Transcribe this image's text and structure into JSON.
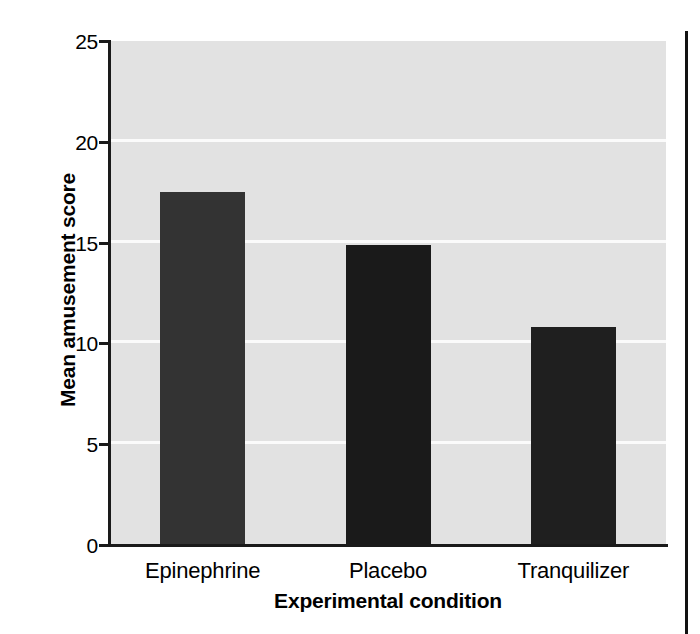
{
  "chart_data": {
    "type": "bar",
    "title": "",
    "xlabel": "Experimental condition",
    "ylabel": "Mean amusement score",
    "categories": [
      "Epinephrine",
      "Placebo",
      "Tranquilizer"
    ],
    "values": [
      17.5,
      14.9,
      10.8
    ],
    "ylim": [
      0,
      25
    ],
    "yticks": [
      0,
      5,
      10,
      15,
      20,
      25
    ],
    "ytick_labels": [
      "0",
      "5",
      "10",
      "15",
      "20",
      "25"
    ],
    "grid": "horizontal-white-gridlines",
    "legend": "none",
    "plot_background": "#e2e2e2",
    "gridline_color": "#fbfbfb",
    "axis_color": "#1a1a1a",
    "bar_colors": [
      "#333333",
      "#1a1a1a",
      "#1f1f1f"
    ],
    "bars": [
      {
        "label": "Epinephrine",
        "value": 17.5,
        "color": "#333333"
      },
      {
        "label": "Placebo",
        "value": 14.9,
        "color": "#1a1a1a"
      },
      {
        "label": "Tranquilizer",
        "value": 10.8,
        "color": "#1f1f1f"
      }
    ]
  }
}
